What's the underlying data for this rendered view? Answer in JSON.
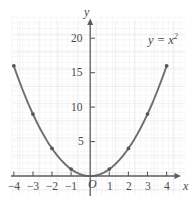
{
  "chart_data": {
    "type": "line",
    "title": "",
    "subtitle": "",
    "xlabel": "x",
    "ylabel": "y",
    "annotations": [
      {
        "text": "y = x²",
        "x": 3.6,
        "y": 19.2
      }
    ],
    "origin_label": "O",
    "grid": true,
    "grid_minor": true,
    "legend": "none",
    "xlim": [
      -4.6,
      4.9
    ],
    "ylim": [
      -1.6,
      21.5
    ],
    "xticks": [
      -4,
      -3,
      -2,
      -1,
      1,
      2,
      3,
      4
    ],
    "yticks": [
      5,
      10,
      15,
      20
    ],
    "xtick_labels": [
      "−4",
      "−3",
      "−2",
      "−1",
      "1",
      "2",
      "3",
      "4"
    ],
    "ytick_labels": [
      "5",
      "10",
      "15",
      "20"
    ],
    "series": [
      {
        "name": "y = x^2",
        "color": "#6e6e6e",
        "marker_color": "#5a5a5a",
        "x": [
          -4,
          -3,
          -2,
          -1,
          0,
          1,
          2,
          3,
          4
        ],
        "values": [
          16,
          9,
          4,
          1,
          0,
          1,
          4,
          9,
          16
        ]
      }
    ],
    "marked_points": [
      {
        "x": -4,
        "y": 16
      },
      {
        "x": -3,
        "y": 9
      },
      {
        "x": -2,
        "y": 4
      },
      {
        "x": -1,
        "y": 1
      },
      {
        "x": 1,
        "y": 1
      },
      {
        "x": 2,
        "y": 4
      },
      {
        "x": 3,
        "y": 9
      },
      {
        "x": 4,
        "y": 16
      }
    ]
  },
  "style": {
    "grid_minor_color": "#e9e9ec",
    "grid_major_color": "#dcdce2",
    "axis_color": "#595959",
    "curve_color": "#6e6e6e",
    "text_color": "#4a4a4a",
    "background": "#ffffff"
  },
  "labels": {
    "y_axis_name": "y",
    "x_axis_name": "x",
    "origin": "O",
    "equation_lhs": "y = x",
    "equation_exponent": "2",
    "ytick_20": "20",
    "ytick_15": "15",
    "ytick_10": "10",
    "ytick_5": "5",
    "xtick_neg4": "−4",
    "xtick_neg3": "−3",
    "xtick_neg2": "−2",
    "xtick_neg1": "−1",
    "xtick_1": "1",
    "xtick_2": "2",
    "xtick_3": "3",
    "xtick_4": "4"
  }
}
